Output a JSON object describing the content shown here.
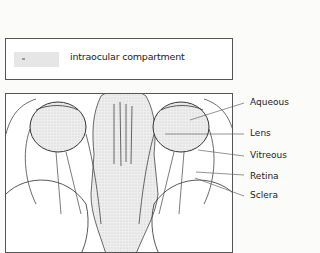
{
  "legend": {
    "swatch_color": "#e6e6e6",
    "label": "intraocular compartment"
  },
  "diagram": {
    "labels": [
      {
        "text": "Aqueous",
        "y": 103
      },
      {
        "text": "Lens",
        "y": 125
      },
      {
        "text": "Vitreous",
        "y": 146
      },
      {
        "text": "Retina",
        "y": 167
      },
      {
        "text": "Sclera",
        "y": 186
      }
    ]
  }
}
